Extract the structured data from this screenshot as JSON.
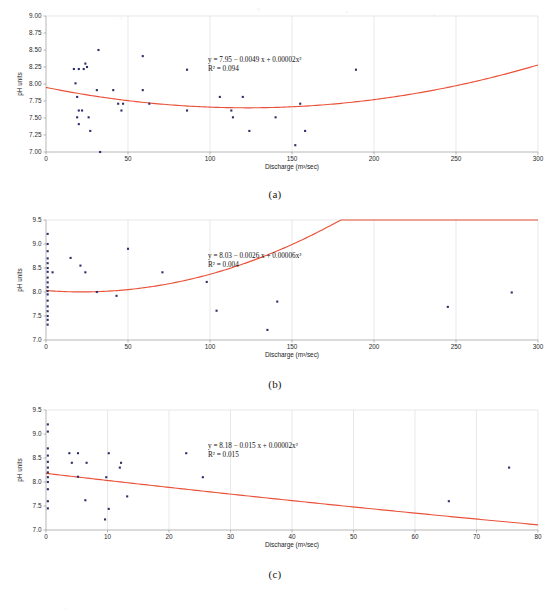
{
  "figure": {
    "panels": [
      {
        "caption": "(a)",
        "ylabel": "pH units",
        "xlabel": "Discharge (m³/sec)",
        "equation": "y = 7.95 − 0.0049 x + 0.00002x²",
        "r2": "R² = 0.094",
        "chart_data": {
          "type": "scatter",
          "title": "(a)",
          "xlabel": "Discharge (m³/sec)",
          "ylabel": "pH units",
          "xlim": [
            0,
            300
          ],
          "ylim": [
            7.0,
            9.0
          ],
          "xticks": [
            0,
            50,
            100,
            150,
            200,
            250,
            300
          ],
          "yticks": [
            7.0,
            7.25,
            7.5,
            7.75,
            8.0,
            8.25,
            8.5,
            8.75,
            9.0
          ],
          "ytick_labels": [
            "7.00",
            "7.25",
            "7.50",
            "7.75",
            "8.00",
            "8.25",
            "8.50",
            "8.75",
            "9.00"
          ],
          "grid": true,
          "points": [
            [
              17,
              8.22
            ],
            [
              20,
              8.22
            ],
            [
              23,
              8.22
            ],
            [
              24,
              8.3
            ],
            [
              25,
              8.25
            ],
            [
              32,
              8.5
            ],
            [
              59,
              8.41
            ],
            [
              86,
              8.21
            ],
            [
              189,
              8.21
            ],
            [
              18,
              8.01
            ],
            [
              31,
              7.91
            ],
            [
              41,
              7.91
            ],
            [
              59,
              7.91
            ],
            [
              19,
              7.81
            ],
            [
              106,
              7.81
            ],
            [
              120,
              7.81
            ],
            [
              44,
              7.71
            ],
            [
              47,
              7.71
            ],
            [
              63,
              7.71
            ],
            [
              155,
              7.71
            ],
            [
              20,
              7.61
            ],
            [
              22,
              7.61
            ],
            [
              46,
              7.61
            ],
            [
              86,
              7.61
            ],
            [
              113,
              7.61
            ],
            [
              19,
              7.51
            ],
            [
              26,
              7.51
            ],
            [
              114,
              7.51
            ],
            [
              140,
              7.51
            ],
            [
              20,
              7.41
            ],
            [
              27,
              7.31
            ],
            [
              124,
              7.31
            ],
            [
              158,
              7.31
            ],
            [
              152,
              7.1
            ],
            [
              33,
              7.0
            ]
          ],
          "trend": {
            "kind": "quadratic",
            "equation": "y = 7.95 − 0.0049 x + 0.00002x²",
            "intercept": 7.95,
            "linear": -0.0049,
            "quadratic": 2e-05,
            "r2": 0.094,
            "color": "#ea5139"
          },
          "point_color": "#2c2f6b"
        }
      },
      {
        "caption": "(b)",
        "ylabel": "pH units",
        "xlabel": "Discharge (m³/sec)",
        "equation": "y = 8.03 − 0.0026 x + 0.00006x²",
        "r2": "R² = 0.004",
        "chart_data": {
          "type": "scatter",
          "title": "(b)",
          "xlabel": "Discharge (m³/sec)",
          "ylabel": "pH units",
          "xlim": [
            0,
            300
          ],
          "ylim": [
            7.0,
            9.5
          ],
          "xticks": [
            0,
            50,
            100,
            150,
            200,
            250,
            300
          ],
          "yticks": [
            7.0,
            7.5,
            8.0,
            8.5,
            9.0,
            9.5
          ],
          "ytick_labels": [
            "7.0",
            "7.5",
            "8.0",
            "8.5",
            "9.0",
            "9.5"
          ],
          "grid": true,
          "points": [
            [
              1,
              9.21
            ],
            [
              1,
              9.0
            ],
            [
              1,
              8.85
            ],
            [
              1,
              8.7
            ],
            [
              1,
              8.6
            ],
            [
              1,
              8.5
            ],
            [
              1,
              8.42
            ],
            [
              1,
              8.3
            ],
            [
              1,
              8.2
            ],
            [
              1,
              8.1
            ],
            [
              1,
              8.02
            ],
            [
              1,
              7.95
            ],
            [
              1,
              7.82
            ],
            [
              1,
              7.7
            ],
            [
              1,
              7.6
            ],
            [
              1,
              7.5
            ],
            [
              1,
              7.42
            ],
            [
              1,
              7.32
            ],
            [
              4,
              8.41
            ],
            [
              15,
              8.71
            ],
            [
              21,
              8.55
            ],
            [
              24,
              8.41
            ],
            [
              50,
              8.9
            ],
            [
              71,
              8.41
            ],
            [
              98,
              8.21
            ],
            [
              31,
              8.0
            ],
            [
              43,
              7.92
            ],
            [
              141,
              7.8
            ],
            [
              245,
              7.69
            ],
            [
              284,
              7.99
            ],
            [
              104,
              7.61
            ],
            [
              135,
              7.21
            ]
          ],
          "trend": {
            "kind": "quadratic",
            "equation": "y = 8.03 − 0.0026 x + 0.00006x²",
            "intercept": 8.03,
            "linear": -0.0026,
            "quadratic": 6e-05,
            "r2": 0.004,
            "color": "#ea5139"
          },
          "point_color": "#2c2f6b"
        }
      },
      {
        "caption": "(c)",
        "ylabel": "pH units",
        "xlabel": "Discharge (m³/sec)",
        "equation": "y = 8.18 − 0.015 x + 0.00002x²",
        "r2": "R² = 0.015",
        "chart_data": {
          "type": "scatter",
          "title": "(c)",
          "xlabel": "Discharge (m³/sec)",
          "ylabel": "pH units",
          "xlim": [
            0,
            80
          ],
          "ylim": [
            7.0,
            9.5
          ],
          "xticks": [
            0,
            10,
            20,
            30,
            40,
            50,
            60,
            70,
            80
          ],
          "yticks": [
            7.0,
            7.5,
            8.0,
            8.5,
            9.0,
            9.5
          ],
          "ytick_labels": [
            "7.0",
            "7.5",
            "8.0",
            "8.5",
            "9.0",
            "9.5"
          ],
          "grid": true,
          "points": [
            [
              0.3,
              9.2
            ],
            [
              0.3,
              9.05
            ],
            [
              0.3,
              8.7
            ],
            [
              0.3,
              8.55
            ],
            [
              0.3,
              8.42
            ],
            [
              0.3,
              8.3
            ],
            [
              0.3,
              8.2
            ],
            [
              0.3,
              8.1
            ],
            [
              0.3,
              8.0
            ],
            [
              0.3,
              7.85
            ],
            [
              0.3,
              7.6
            ],
            [
              0.3,
              7.45
            ],
            [
              3.8,
              8.6
            ],
            [
              5.2,
              8.6
            ],
            [
              10.2,
              8.6
            ],
            [
              22.8,
              8.6
            ],
            [
              4.2,
              8.4
            ],
            [
              6.6,
              8.4
            ],
            [
              12.2,
              8.4
            ],
            [
              12.0,
              8.3
            ],
            [
              5.2,
              8.11
            ],
            [
              9.8,
              8.1
            ],
            [
              25.5,
              8.1
            ],
            [
              75.3,
              8.3
            ],
            [
              13.2,
              7.7
            ],
            [
              6.4,
              7.62
            ],
            [
              65.5,
              7.6
            ],
            [
              10.2,
              7.44
            ],
            [
              9.6,
              7.22
            ]
          ],
          "trend": {
            "kind": "quadratic",
            "equation": "y = 8.18 − 0.015 x + 0.00002x²",
            "intercept": 8.18,
            "linear": -0.015,
            "quadratic": 2e-05,
            "r2": 0.015,
            "color": "#ea5139"
          },
          "point_color": "#2c2f6b"
        }
      }
    ]
  }
}
